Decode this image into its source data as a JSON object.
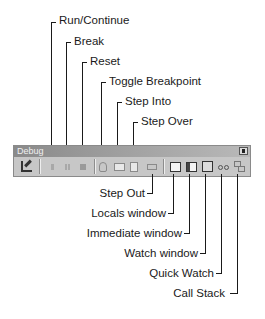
{
  "toolbar": {
    "title": "Debug",
    "close_label": "×",
    "buttons": [
      {
        "id": "design-mode",
        "icon": "design-mode-icon"
      },
      {
        "id": "run-continue",
        "icon": "play-icon"
      },
      {
        "id": "break",
        "icon": "pause-icon"
      },
      {
        "id": "reset",
        "icon": "stop-icon"
      },
      {
        "id": "toggle-breakpoint",
        "icon": "hand-icon"
      },
      {
        "id": "step-into",
        "icon": "step-into-icon"
      },
      {
        "id": "step-over",
        "icon": "step-over-icon"
      },
      {
        "id": "step-out",
        "icon": "step-out-icon"
      },
      {
        "id": "locals-window",
        "icon": "locals-window-icon"
      },
      {
        "id": "immediate-window",
        "icon": "immediate-window-icon"
      },
      {
        "id": "watch-window",
        "icon": "watch-window-icon"
      },
      {
        "id": "quick-watch",
        "icon": "glasses-icon"
      },
      {
        "id": "call-stack",
        "icon": "call-stack-icon"
      }
    ]
  },
  "callouts_top": [
    {
      "label": "Run/Continue"
    },
    {
      "label": "Break"
    },
    {
      "label": "Reset"
    },
    {
      "label": "Toggle Breakpoint"
    },
    {
      "label": "Step Into"
    },
    {
      "label": "Step Over"
    }
  ],
  "callouts_bottom": [
    {
      "label": "Step Out"
    },
    {
      "label": "Locals window"
    },
    {
      "label": "Immediate window"
    },
    {
      "label": "Watch window"
    },
    {
      "label": "Quick Watch"
    },
    {
      "label": "Call Stack"
    }
  ]
}
